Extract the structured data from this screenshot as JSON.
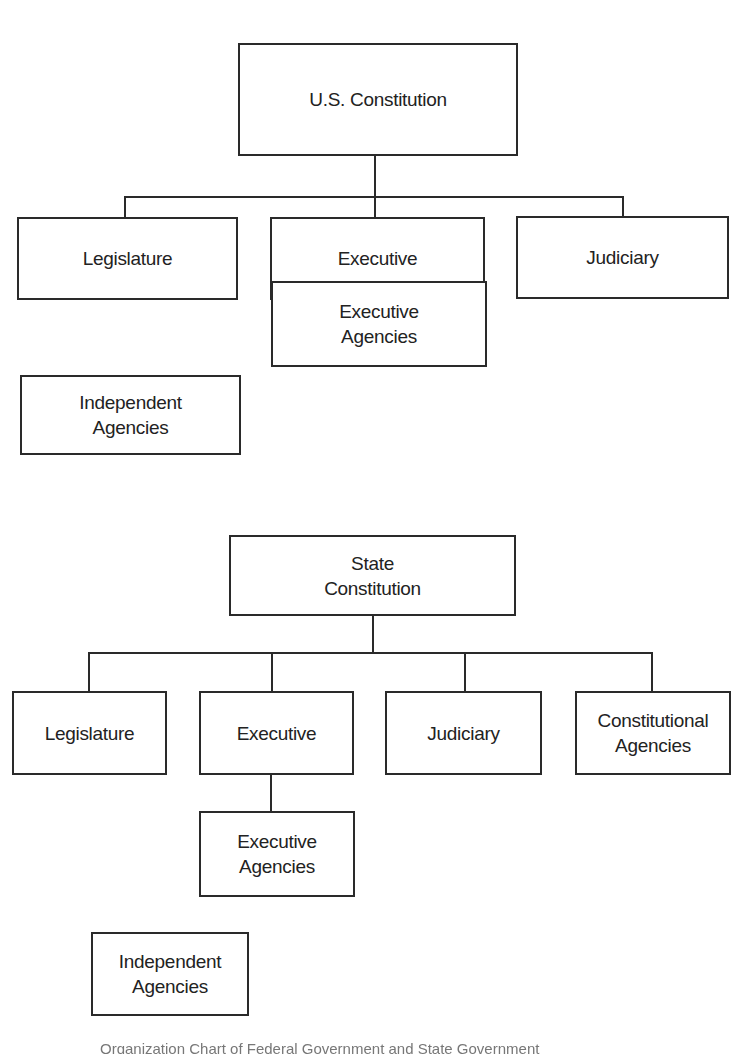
{
  "diagram": {
    "federal": {
      "root": "U.S. Constitution",
      "branches": [
        "Legislature",
        "Executive",
        "Judiciary"
      ],
      "executive_child": "Executive\nAgencies",
      "standalone": "Independent\nAgencies"
    },
    "state": {
      "root": "State\nConstitution",
      "branches": [
        "Legislature",
        "Executive",
        "Judiciary",
        "Constitutional\nAgencies"
      ],
      "executive_child": "Executive\nAgencies",
      "standalone": "Independent\nAgencies"
    }
  },
  "caption": "Organization Chart of Federal Government and State Government"
}
